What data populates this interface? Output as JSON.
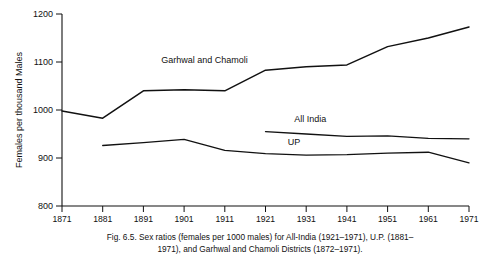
{
  "figure": {
    "caption_line1": "Fig. 6.5. Sex ratios (females per 1000 males) for All-India (1921–1971), U.P. (1881–",
    "caption_line2": "1971), and Garhwal and Chamoli Districts (1872–1971)."
  },
  "chart_data": {
    "type": "line",
    "title": "",
    "xlabel": "",
    "ylabel": "Females per thousand Males",
    "x": [
      1871,
      1881,
      1891,
      1901,
      1911,
      1921,
      1931,
      1941,
      1951,
      1961,
      1971
    ],
    "xticklabels": [
      "1871",
      "1881",
      "1891",
      "1901",
      "1911",
      "1921",
      "1931",
      "1941",
      "1951",
      "1961",
      "1971"
    ],
    "yticks": [
      800,
      900,
      1000,
      1100,
      1200
    ],
    "yticklabels": [
      "800",
      "900",
      "1000",
      "1100",
      "1200"
    ],
    "ylim": [
      800,
      1200
    ],
    "xlim": [
      1871,
      1971
    ],
    "grid": false,
    "legend": "inline-labels",
    "series": [
      {
        "name": "Garhwal and Chamoli",
        "label": "Garhwal and Chamoli",
        "x": [
          1871,
          1881,
          1891,
          1901,
          1911,
          1921,
          1931,
          1941,
          1951,
          1961,
          1971
        ],
        "values": [
          998,
          983,
          1040,
          1042,
          1040,
          1083,
          1090,
          1094,
          1132,
          1150,
          1173
        ]
      },
      {
        "name": "All India",
        "label": "All India",
        "x": [
          1921,
          1931,
          1941,
          1951,
          1961,
          1971
        ],
        "values": [
          955,
          950,
          945,
          946,
          941,
          940
        ]
      },
      {
        "name": "UP",
        "label": "UP",
        "x": [
          1881,
          1891,
          1901,
          1911,
          1921,
          1931,
          1941,
          1951,
          1961,
          1971
        ],
        "values": [
          926,
          932,
          939,
          916,
          909,
          906,
          907,
          910,
          912,
          890
        ]
      }
    ],
    "annotations": [
      {
        "text": "Garhwal and Chamoli",
        "x": 1906,
        "y": 1097
      },
      {
        "text": "All India",
        "x": 1932,
        "y": 975
      },
      {
        "text": "UP",
        "x": 1928,
        "y": 928
      }
    ]
  }
}
